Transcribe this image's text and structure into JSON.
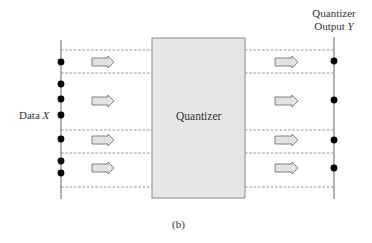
{
  "figure": {
    "caption": "(b)",
    "input_label": {
      "prefix": "Data ",
      "variable": "X"
    },
    "block_label": "Quantizer",
    "output_label": {
      "line1": "Quantizer",
      "line2_prefix": "Output ",
      "variable": "Y"
    }
  },
  "colors": {
    "block_fill": "#e6e6e6",
    "block_stroke": "#8a8a8a",
    "axis_line": "#666666",
    "dashed_line": "#7a7a7a",
    "dot": "#000000",
    "arrow_fill": "#e2e2e2",
    "arrow_stroke": "#6a6a6a"
  },
  "layout": {
    "input_axis_x": 61,
    "output_axis_x": 334,
    "block": {
      "x": 152,
      "y": 38,
      "w": 93,
      "h": 160
    },
    "boundaries_y": [
      50,
      73,
      130,
      153,
      187
    ],
    "input_dots_y": [
      62,
      84,
      99,
      115,
      139,
      161,
      173
    ],
    "output_dots_y": [
      61,
      100,
      140,
      168
    ],
    "arrow_rows_y": [
      62,
      101,
      140,
      168
    ],
    "left_arrow_x": [
      92,
      114
    ],
    "right_arrow_x": [
      275,
      298
    ]
  }
}
